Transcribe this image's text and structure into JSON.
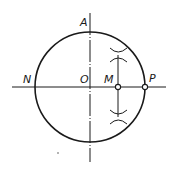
{
  "diagram": {
    "type": "geometric-construction",
    "colors": {
      "stroke": "#1a1a1a",
      "background": "#ffffff"
    },
    "circle": {
      "cx": 90,
      "cy": 87,
      "r": 55
    },
    "points": {
      "A": {
        "label": "A",
        "x": 90,
        "y": 32
      },
      "N": {
        "label": "N",
        "x": 35,
        "y": 87
      },
      "O": {
        "label": "O",
        "x": 90,
        "y": 87
      },
      "M": {
        "label": "M",
        "x": 118,
        "y": 87
      },
      "P": {
        "label": "P",
        "x": 145,
        "y": 87
      }
    },
    "horizontal_axis": {
      "x1": 12,
      "x2": 166,
      "y": 87
    },
    "vertical_axis": {
      "x": 90,
      "y1": 13,
      "y2": 162
    },
    "perpendicular_bisector": {
      "x": 118,
      "y1": 55,
      "y2": 117
    },
    "arc_marks": [
      {
        "x": 118,
        "y": 55
      },
      {
        "x": 118,
        "y": 117
      }
    ]
  }
}
